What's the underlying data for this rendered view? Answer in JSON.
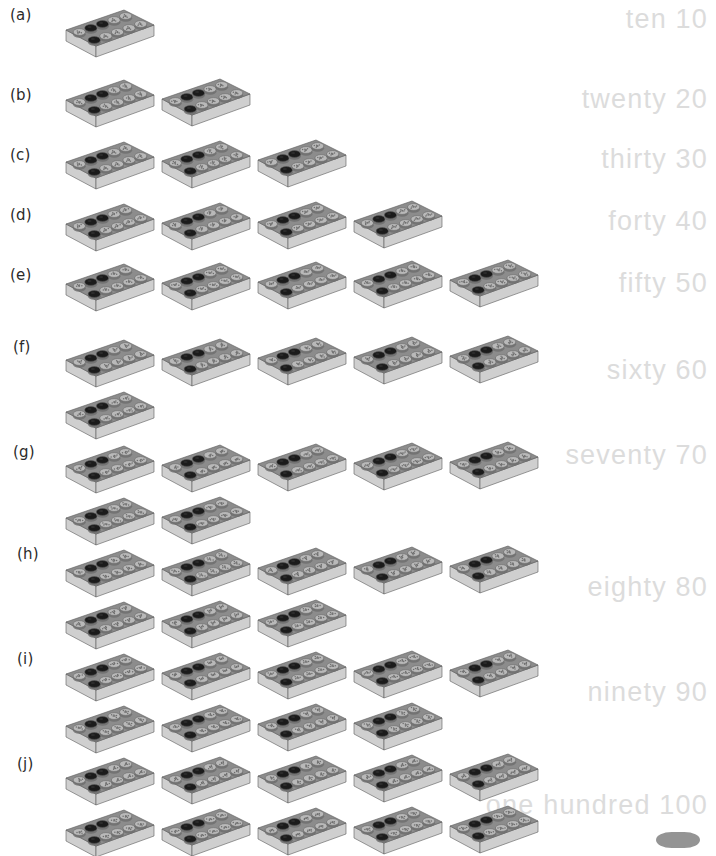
{
  "page": {
    "background": "#ffffff",
    "letter_color": "#2b2b2b",
    "word_color": "#dcdcdc",
    "brick": {
      "top_face": "#8c8c8c",
      "front_face": "#cfcfcf",
      "side_face": "#a8a8a8",
      "stud_dark": "#1b1b1b",
      "stud_light": "#b9b9b9",
      "stud_mid": "#6f6f6f",
      "outline": "#5a5a5a",
      "studs_per_brick": 10,
      "stud_rows": 2,
      "stud_cols": 5
    }
  },
  "rows": [
    {
      "letter": "(a)",
      "word": "ten",
      "number": "10",
      "word_number": "ten 10",
      "count": 1,
      "top_row": 1,
      "bottom_row": 0,
      "letter_top": 6,
      "word_top": 4,
      "row_top": 0,
      "row_height": 70
    },
    {
      "letter": "(b)",
      "word": "twenty",
      "number": "20",
      "word_number": "twenty 20",
      "count": 2,
      "top_row": 2,
      "bottom_row": 0,
      "letter_top": 86,
      "word_top": 84,
      "row_top": 70,
      "row_height": 62
    },
    {
      "letter": "(c)",
      "word": "thirty",
      "number": "30",
      "word_number": "thirty 30",
      "count": 3,
      "top_row": 3,
      "bottom_row": 0,
      "letter_top": 146,
      "word_top": 144,
      "row_top": 132,
      "row_height": 62
    },
    {
      "letter": "(d)",
      "word": "forty",
      "number": "40",
      "word_number": "forty 40",
      "count": 4,
      "top_row": 4,
      "bottom_row": 0,
      "letter_top": 206,
      "word_top": 206,
      "row_top": 194,
      "row_height": 62
    },
    {
      "letter": "(e)",
      "word": "fifty",
      "number": "50",
      "word_number": "fifty 50",
      "count": 5,
      "top_row": 5,
      "bottom_row": 0,
      "letter_top": 266,
      "word_top": 268,
      "row_top": 254,
      "row_height": 62
    },
    {
      "letter": "(f)",
      "word": "sixty",
      "number": "60",
      "word_number": "sixty 60",
      "count": 6,
      "top_row": 5,
      "bottom_row": 1,
      "letter_top": 338,
      "word_top": 355,
      "row_top": 330,
      "row_height": 105
    },
    {
      "letter": "(g)",
      "word": "seventy",
      "number": "70",
      "word_number": "seventy 70",
      "count": 7,
      "top_row": 5,
      "bottom_row": 2,
      "letter_top": 443,
      "word_top": 440,
      "row_top": 436,
      "row_height": 104
    },
    {
      "letter": "(h)",
      "word": "eighty",
      "number": "80",
      "word_number": "eighty 80",
      "count": 8,
      "top_row": 5,
      "bottom_row": 3,
      "letter_top": 545,
      "word_top": 572,
      "row_top": 540,
      "row_height": 104
    },
    {
      "letter": "(i)",
      "word": "ninety",
      "number": "90",
      "word_number": "ninety 90",
      "count": 9,
      "top_row": 5,
      "bottom_row": 4,
      "letter_top": 650,
      "word_top": 677,
      "row_top": 644,
      "row_height": 104
    },
    {
      "letter": "(j)",
      "word": "one hundred",
      "number": "100",
      "word_number": "one hundred 100",
      "count": 10,
      "top_row": 5,
      "bottom_row": 5,
      "letter_top": 755,
      "word_top": 790,
      "row_top": 748,
      "row_height": 108
    }
  ]
}
